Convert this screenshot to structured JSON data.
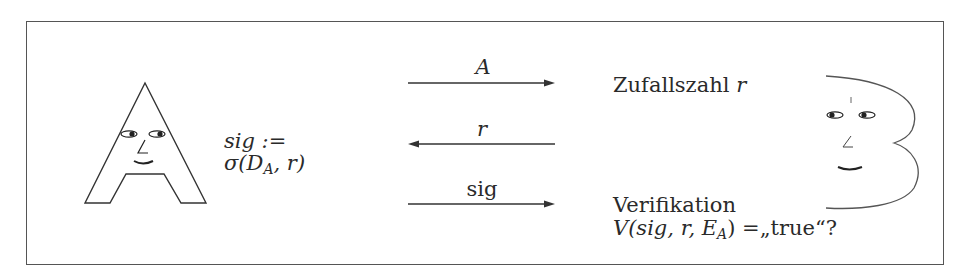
{
  "diagram": {
    "type": "challenge-response-signature-protocol",
    "left_party": {
      "figure": "A-shaped face (prover)",
      "computation": {
        "line1": "sig :=",
        "line2_prefix": "σ(D",
        "line2_sub": "A",
        "line2_suffix": ", r)"
      }
    },
    "right_party": {
      "figure": "B-shaped face (verifier)",
      "step1": {
        "text": "Zufallszahl ",
        "var": "r"
      },
      "step2": {
        "line1": "Verifikation",
        "line2_prefix": "V(sig, r, E",
        "line2_sub": "A",
        "line2_suffix": ") =„true“?"
      }
    },
    "messages": [
      {
        "label": "A",
        "direction": "right",
        "italic": true
      },
      {
        "label": "r",
        "direction": "left",
        "italic": true
      },
      {
        "label": "sig",
        "direction": "right",
        "italic": false
      }
    ],
    "colors": {
      "line": "#333333",
      "frame": "#555555",
      "background": "#ffffff"
    }
  }
}
